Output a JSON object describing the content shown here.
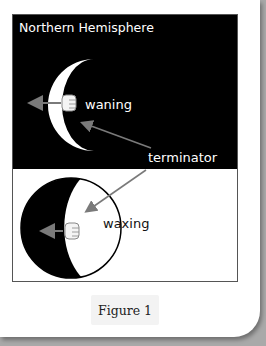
{
  "figure": {
    "title": "Northern Hemisphere",
    "labels": {
      "waning": "waning",
      "terminator": "terminator",
      "waxing": "waxing"
    },
    "caption": "Figure 1",
    "colors": {
      "top_panel_bg": "#000000",
      "bottom_panel_bg": "#ffffff",
      "arrow": "#7a7a7a",
      "lit": "#ffffff",
      "dark": "#000000"
    }
  }
}
